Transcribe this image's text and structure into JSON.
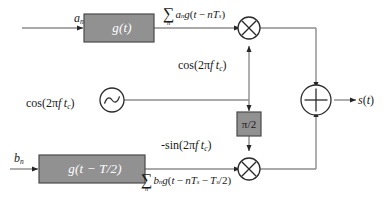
{
  "diagram": {
    "type": "signal-flow-block-diagram",
    "colors": {
      "block_fill": "#919191",
      "block_stroke": "#4a4a4a",
      "block_text": "#ffffff",
      "line": "#8c8c8c",
      "node_stroke": "#2b2b2b",
      "node_fill": "#ffffff",
      "text": "#1a1a1a",
      "background": "#ffffff"
    },
    "inputs": [
      {
        "id": "in-a",
        "label_base": "a",
        "label_sub": "n",
        "branch": "in-phase"
      },
      {
        "id": "in-b",
        "label_base": "b",
        "label_sub": "n",
        "branch": "quadrature"
      }
    ],
    "blocks": [
      {
        "id": "pulse-shape-i",
        "label": "g(t)",
        "shape": "rectangle",
        "fill": "#919191"
      },
      {
        "id": "pulse-shape-q",
        "label": "g(t − T/2)",
        "shape": "rectangle",
        "fill": "#919191"
      },
      {
        "id": "phase-shift",
        "label": "π/2",
        "shape": "rectangle",
        "fill": "#919191"
      }
    ],
    "expressions": {
      "top_sum": {
        "sigma": "∑",
        "index": "n",
        "body_parts": [
          {
            "t": "a",
            "style": "italic"
          },
          {
            "t": "n",
            "style": "sub"
          },
          {
            "t": "g",
            "style": "italic"
          },
          {
            "t": "(",
            "style": "upright"
          },
          {
            "t": "t",
            "style": "italic"
          },
          {
            "t": " − ",
            "style": "upright"
          },
          {
            "t": "n",
            "style": "italic"
          },
          {
            "t": "T",
            "style": "italic"
          },
          {
            "t": "s",
            "style": "sub"
          },
          {
            "t": ")",
            "style": "upright"
          }
        ],
        "plain": "∑n an g(t − nTs)"
      },
      "bottom_sum": {
        "sigma": "∑",
        "index": "n",
        "body_parts": [
          {
            "t": "b",
            "style": "italic"
          },
          {
            "t": "n",
            "style": "sub"
          },
          {
            "t": "g",
            "style": "italic"
          },
          {
            "t": "(",
            "style": "upright"
          },
          {
            "t": "t",
            "style": "italic"
          },
          {
            "t": " − ",
            "style": "upright"
          },
          {
            "t": "n",
            "style": "italic"
          },
          {
            "t": "T",
            "style": "italic"
          },
          {
            "t": "s",
            "style": "sub"
          },
          {
            "t": " − ",
            "style": "upright"
          },
          {
            "t": "T",
            "style": "italic"
          },
          {
            "t": "s",
            "style": "sub"
          },
          {
            "t": "/2",
            "style": "upright"
          },
          {
            "t": ")",
            "style": "upright"
          }
        ],
        "plain": "∑n bn g(t − nTs − Ts/2)"
      }
    },
    "carriers": {
      "cos_branch": "cos(2πf t_c)",
      "cos_oscillator": "cos(2πf t_c)",
      "neg_sin_branch": "-sin(2πf t_c)"
    },
    "nodes": [
      {
        "id": "mixer-i",
        "symbol": "⊗",
        "name": "multiplier"
      },
      {
        "id": "mixer-q",
        "symbol": "⊗",
        "name": "multiplier"
      },
      {
        "id": "summer",
        "symbol": "⊕",
        "name": "adder"
      },
      {
        "id": "oscillator",
        "symbol": "sine-wave",
        "name": "local-oscillator"
      }
    ],
    "output": {
      "label": "s(t)",
      "name": "modulated-signal"
    }
  }
}
